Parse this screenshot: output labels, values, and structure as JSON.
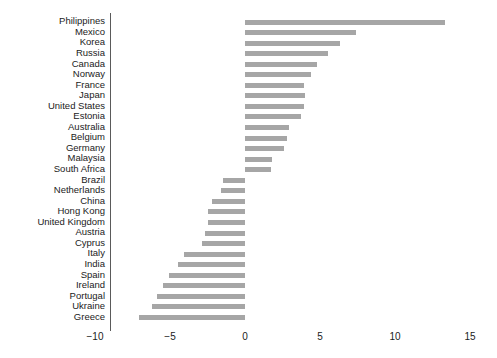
{
  "chart_data": {
    "type": "bar",
    "orientation": "horizontal",
    "title": "",
    "subtitle": "",
    "xlabel": "",
    "ylabel": "",
    "xlim": [
      -10,
      15
    ],
    "xticks": [
      -10,
      -5,
      0,
      5,
      10,
      15
    ],
    "xticklabels": [
      "−10",
      "−5",
      "0",
      "5",
      "10",
      "15"
    ],
    "grid": false,
    "legend": null,
    "bar_color": "#a6a6a6",
    "axis_color": "#5a5a5a",
    "zero_line": 0,
    "categories": [
      "Philippines",
      "Mexico",
      "Korea",
      "Russia",
      "Canada",
      "Norway",
      "France",
      "Japan",
      "United States",
      "Estonia",
      "Australia",
      "Belgium",
      "Germany",
      "Malaysia",
      "South Africa",
      "Brazil",
      "Netherlands",
      "China",
      "Hong Kong",
      "United Kingdom",
      "Austria",
      "Cyprus",
      "Italy",
      "India",
      "Spain",
      "Ireland",
      "Portugal",
      "Ukraine",
      "Greece"
    ],
    "values": [
      13.3,
      7.4,
      6.3,
      5.5,
      4.8,
      4.4,
      3.9,
      4.0,
      3.9,
      3.7,
      2.9,
      2.8,
      2.6,
      1.8,
      1.7,
      -1.5,
      -1.6,
      -2.2,
      -2.5,
      -2.5,
      -2.7,
      -2.9,
      -4.1,
      -4.5,
      -5.1,
      -5.5,
      -5.9,
      -6.2,
      -7.1
    ]
  }
}
